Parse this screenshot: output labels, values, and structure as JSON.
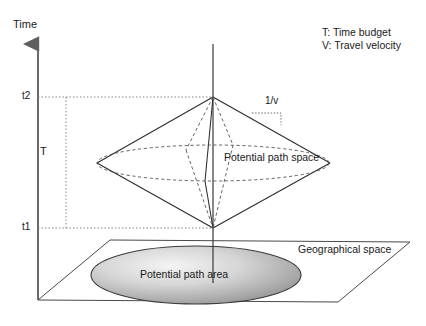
{
  "figure": {
    "background_color": "#ffffff",
    "line_color": "#2b2b2b",
    "dotted_color": "#6e6e6e",
    "ellipse_fill_light": "#f2f2f2",
    "ellipse_fill_dark": "#8e8e8e"
  },
  "axis": {
    "time_label": "Time",
    "ticks": [
      {
        "id": "t2",
        "label": "t2",
        "y": 97
      },
      {
        "id": "t1",
        "label": "t1",
        "y": 228
      }
    ],
    "budget_label": "T"
  },
  "annotations": {
    "slope_label": "1/v",
    "potential_path_space": "Potential path space",
    "potential_path_area": "Potential path area",
    "geographical_space": "Geographical space"
  },
  "legend": {
    "items": [
      {
        "key": "T",
        "text": "T: Time budget"
      },
      {
        "key": "V",
        "text": "V: Travel velocity"
      }
    ]
  },
  "geometry": {
    "type": "diagram",
    "apex_top": {
      "x": 213,
      "y": 97
    },
    "apex_bottom": {
      "x": 213,
      "y": 228
    },
    "waist_left": {
      "x": 97,
      "y": 163
    },
    "waist_right": {
      "x": 330,
      "y": 163
    },
    "waist_front": {
      "x": 213,
      "y": 181
    },
    "waist_back": {
      "x": 213,
      "y": 145
    },
    "waist_rx": 116,
    "waist_ry": 18,
    "plane_corners": [
      {
        "x": 110,
        "y": 240
      },
      {
        "x": 410,
        "y": 242
      },
      {
        "x": 338,
        "y": 302
      },
      {
        "x": 38,
        "y": 300
      }
    ],
    "area_ellipse": {
      "cx": 196,
      "cy": 275,
      "rx": 105,
      "ry": 29
    },
    "axis_origin": {
      "x": 38,
      "y": 300
    },
    "axis_top": {
      "x": 38,
      "y": 38
    }
  }
}
